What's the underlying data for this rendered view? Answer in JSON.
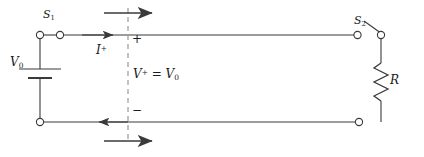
{
  "figure": {
    "stroke_color": "#3a3a3a",
    "label_color": "#1a1a1a",
    "dash_color": "#9a9a9a"
  },
  "labels": {
    "switch_1": "S",
    "switch_1_sub": "1",
    "switch_2": "S",
    "switch_2_sub": "2",
    "source": "V",
    "source_sub": "0",
    "current": "I",
    "current_sup": "+",
    "voltage_lhs": "V",
    "voltage_lhs_sup": "+",
    "voltage_eq": " = ",
    "voltage_rhs": "V",
    "voltage_rhs_sub": "0",
    "resistor": "R",
    "polarity_plus": "+",
    "polarity_minus": "−"
  },
  "components": {
    "battery_name": "dc-voltage-source",
    "switch_1_state": "closed",
    "switch_2_state": "open",
    "resistor_name": "load-resistor",
    "dashed_reference_plane": "wave-front-reference-plane"
  },
  "arrows": {
    "top_direction": "right",
    "conductor_top_direction": "right",
    "conductor_bottom_direction": "left",
    "bottom_direction": "right"
  }
}
